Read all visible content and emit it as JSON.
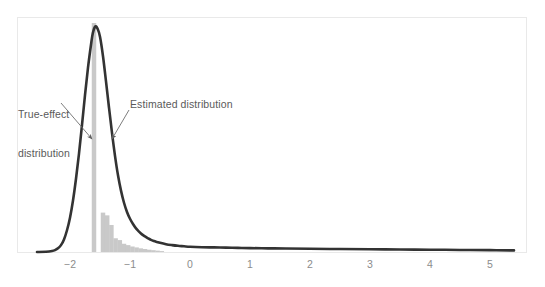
{
  "chart_data": {
    "type": "area",
    "title": "",
    "subtitle": "",
    "xlabel": "",
    "ylabel": "",
    "xlim": [
      -2.55,
      5.45
    ],
    "ylim": [
      0,
      1.0
    ],
    "grid": false,
    "legend_position": "none",
    "xticks": [
      -2,
      -1,
      0,
      1,
      2,
      3,
      4,
      5
    ],
    "xticklabels": [
      "−2",
      "−1",
      "0",
      "1",
      "2",
      "3",
      "4",
      "5"
    ],
    "yticks": [],
    "yticklabels": [],
    "annotations": [
      {
        "name": "true-effect-distribution",
        "text": "True-effect\ndistribution",
        "line1": "True-effect",
        "line2": "distribution",
        "points_to_x": -1.58,
        "points_to_y": 0.45
      },
      {
        "name": "estimated-distribution",
        "text": "Estimated distribution",
        "line1": "Estimated distribution",
        "line2": "",
        "points_to_x": -1.28,
        "points_to_y": 0.45
      }
    ],
    "series": [
      {
        "name": "True-effect distribution",
        "type": "bar",
        "color": "#c9c9c9",
        "bar_width": 0.075,
        "x": [
          -1.6,
          -1.45,
          -1.38,
          -1.31,
          -1.24,
          -1.17,
          -1.1,
          -1.03,
          -0.96,
          -0.89,
          -0.82,
          -0.75,
          -0.68,
          -0.61,
          -0.54,
          -0.47
        ],
        "values": [
          1.0,
          0.172,
          0.16,
          0.118,
          0.06,
          0.052,
          0.036,
          0.03,
          0.024,
          0.02,
          0.016,
          0.013,
          0.01,
          0.008,
          0.006,
          0.004
        ]
      },
      {
        "name": "Estimated distribution",
        "type": "line",
        "color": "#333333",
        "line_width": 2.6,
        "x": [
          -2.55,
          -2.4,
          -2.3,
          -2.25,
          -2.2,
          -2.15,
          -2.1,
          -2.05,
          -2.0,
          -1.95,
          -1.9,
          -1.85,
          -1.8,
          -1.75,
          -1.7,
          -1.65,
          -1.62,
          -1.58,
          -1.54,
          -1.5,
          -1.45,
          -1.4,
          -1.35,
          -1.3,
          -1.25,
          -1.2,
          -1.15,
          -1.1,
          -1.05,
          -1.0,
          -0.95,
          -0.9,
          -0.85,
          -0.8,
          -0.75,
          -0.7,
          -0.65,
          -0.6,
          -0.55,
          -0.5,
          -0.4,
          -0.3,
          -0.2,
          -0.1,
          0.0,
          0.2,
          0.4,
          0.6,
          0.8,
          1.0,
          1.3,
          1.6,
          2.0,
          2.5,
          3.0,
          3.5,
          4.0,
          4.5,
          5.0,
          5.4
        ],
        "values": [
          0.0,
          0.001,
          0.004,
          0.008,
          0.016,
          0.03,
          0.055,
          0.095,
          0.15,
          0.225,
          0.32,
          0.43,
          0.555,
          0.685,
          0.805,
          0.905,
          0.955,
          0.985,
          0.975,
          0.94,
          0.855,
          0.745,
          0.63,
          0.52,
          0.42,
          0.335,
          0.268,
          0.215,
          0.175,
          0.145,
          0.122,
          0.103,
          0.089,
          0.077,
          0.068,
          0.06,
          0.053,
          0.048,
          0.044,
          0.04,
          0.034,
          0.03,
          0.027,
          0.025,
          0.023,
          0.021,
          0.02,
          0.019,
          0.018,
          0.017,
          0.016,
          0.015,
          0.014,
          0.013,
          0.012,
          0.011,
          0.01,
          0.009,
          0.008,
          0.007
        ]
      }
    ],
    "colors": {
      "bar": "#c9c9c9",
      "curve": "#333333",
      "frame": "#e9e9e9",
      "tick_label": "#8c8c8c",
      "annotation_text": "#5a5a5a",
      "annotation_arrow": "#6e6e6e",
      "background": "#ffffff"
    }
  },
  "axis": {
    "tick_0": "−2",
    "tick_1": "−1",
    "tick_2": "0",
    "tick_3": "1",
    "tick_4": "2",
    "tick_5": "3",
    "tick_6": "4",
    "tick_7": "5"
  },
  "labels": {
    "true_effect_line1": "True-effect",
    "true_effect_line2": "distribution",
    "estimated": "Estimated distribution"
  }
}
